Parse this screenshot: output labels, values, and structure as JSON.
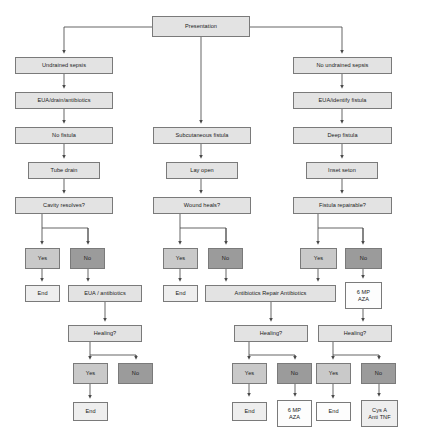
{
  "diagram": {
    "colors": {
      "box_light": "#e3e3e3",
      "box_mid": "#c9c9c9",
      "box_dark": "#9b9b9b",
      "box_white": "#fdfdfd",
      "border": "#7a7a7a",
      "connector": "#4a4a4a",
      "background": "#ffffff"
    },
    "nodes": [
      {
        "id": "presentation",
        "label": "Presentation",
        "x": 152,
        "y": 16,
        "w": 98,
        "h": 21,
        "fill": "fill-light"
      },
      {
        "id": "undrained-sepsis",
        "label": "Undrained sepsis",
        "x": 15,
        "y": 57,
        "w": 98,
        "h": 17,
        "fill": "fill-light"
      },
      {
        "id": "eua-drain-abx",
        "label": "EUA/drain/antibiotics",
        "x": 15,
        "y": 92,
        "w": 98,
        "h": 17,
        "fill": "fill-light"
      },
      {
        "id": "no-fistula",
        "label": "No fistula",
        "x": 15,
        "y": 127,
        "w": 98,
        "h": 17,
        "fill": "fill-light"
      },
      {
        "id": "tube-drain",
        "label": "Tube drain",
        "x": 28,
        "y": 162,
        "w": 72,
        "h": 17,
        "fill": "fill-light"
      },
      {
        "id": "cavity-resolves",
        "label": "Cavity resolves?",
        "x": 15,
        "y": 197,
        "w": 98,
        "h": 17,
        "fill": "fill-light"
      },
      {
        "id": "cavity-yes",
        "label": "Yes",
        "x": 25,
        "y": 248,
        "w": 35,
        "h": 21,
        "fill": "fill-mid"
      },
      {
        "id": "cavity-no",
        "label": "No",
        "x": 70,
        "y": 248,
        "w": 35,
        "h": 21,
        "fill": "fill-dark"
      },
      {
        "id": "cavity-end",
        "label": "End",
        "x": 25,
        "y": 285,
        "w": 35,
        "h": 17,
        "fill": "fill-faint"
      },
      {
        "id": "eua-antibiotics",
        "label": "EUA / antibiotics",
        "x": 68,
        "y": 285,
        "w": 74,
        "h": 17,
        "fill": "fill-light"
      },
      {
        "id": "healing-left",
        "label": "Healing?",
        "x": 68,
        "y": 325,
        "w": 74,
        "h": 17,
        "fill": "fill-light"
      },
      {
        "id": "healing-left-yes",
        "label": "Yes",
        "x": 73,
        "y": 363,
        "w": 35,
        "h": 21,
        "fill": "fill-mid"
      },
      {
        "id": "healing-left-no",
        "label": "No",
        "x": 118,
        "y": 363,
        "w": 35,
        "h": 21,
        "fill": "fill-dark"
      },
      {
        "id": "healing-left-end",
        "label": "End",
        "x": 73,
        "y": 402,
        "w": 35,
        "h": 19,
        "fill": "fill-faint"
      },
      {
        "id": "subcut-fistula",
        "label": "Subcutaneous fistula",
        "x": 153,
        "y": 127,
        "w": 98,
        "h": 17,
        "fill": "fill-light"
      },
      {
        "id": "lay-open",
        "label": "Lay open",
        "x": 166,
        "y": 162,
        "w": 72,
        "h": 17,
        "fill": "fill-light"
      },
      {
        "id": "wound-heals",
        "label": "Wound heals?",
        "x": 153,
        "y": 197,
        "w": 98,
        "h": 17,
        "fill": "fill-light"
      },
      {
        "id": "wound-yes",
        "label": "Yes",
        "x": 163,
        "y": 248,
        "w": 35,
        "h": 21,
        "fill": "fill-mid"
      },
      {
        "id": "wound-no",
        "label": "No",
        "x": 208,
        "y": 248,
        "w": 35,
        "h": 21,
        "fill": "fill-dark"
      },
      {
        "id": "wound-end",
        "label": "End",
        "x": 163,
        "y": 285,
        "w": 35,
        "h": 17,
        "fill": "fill-faint"
      },
      {
        "id": "abx-repair-abx",
        "label": "Antibiotics Repair Antibiotics",
        "x": 205,
        "y": 285,
        "w": 131,
        "h": 17,
        "fill": "fill-light"
      },
      {
        "id": "healing-mid",
        "label": "Healing?",
        "x": 234,
        "y": 325,
        "w": 74,
        "h": 17,
        "fill": "fill-light"
      },
      {
        "id": "healing-mid-yes",
        "label": "Yes",
        "x": 232,
        "y": 363,
        "w": 35,
        "h": 21,
        "fill": "fill-mid"
      },
      {
        "id": "healing-mid-no",
        "label": "No",
        "x": 277,
        "y": 363,
        "w": 35,
        "h": 21,
        "fill": "fill-dark"
      },
      {
        "id": "healing-mid-end",
        "label": "End",
        "x": 232,
        "y": 402,
        "w": 35,
        "h": 19,
        "fill": "fill-faint"
      },
      {
        "id": "healing-mid-6mp",
        "label": "6 MP\nAZA",
        "x": 277,
        "y": 400,
        "w": 35,
        "h": 27,
        "fill": "fill-white"
      },
      {
        "id": "no-undrained-sepsis",
        "label": "No undrained sepsis",
        "x": 293,
        "y": 57,
        "w": 99,
        "h": 17,
        "fill": "fill-light"
      },
      {
        "id": "eua-identify",
        "label": "EUA/identify fistula",
        "x": 293,
        "y": 92,
        "w": 99,
        "h": 17,
        "fill": "fill-light"
      },
      {
        "id": "deep-fistula",
        "label": "Deep fistula",
        "x": 293,
        "y": 127,
        "w": 99,
        "h": 17,
        "fill": "fill-light"
      },
      {
        "id": "inset-seton",
        "label": "Inset seton",
        "x": 306,
        "y": 162,
        "w": 72,
        "h": 17,
        "fill": "fill-light"
      },
      {
        "id": "fistula-repairable",
        "label": "Fistula repairable?",
        "x": 293,
        "y": 197,
        "w": 99,
        "h": 17,
        "fill": "fill-light"
      },
      {
        "id": "fistula-yes",
        "label": "Yes",
        "x": 300,
        "y": 248,
        "w": 37,
        "h": 21,
        "fill": "fill-mid"
      },
      {
        "id": "fistula-no",
        "label": "No",
        "x": 345,
        "y": 248,
        "w": 37,
        "h": 21,
        "fill": "fill-dark"
      },
      {
        "id": "fistula-6mp",
        "label": "6 MP\nAZA",
        "x": 345,
        "y": 282,
        "w": 37,
        "h": 27,
        "fill": "fill-white"
      },
      {
        "id": "healing-right",
        "label": "Healing?",
        "x": 318,
        "y": 325,
        "w": 74,
        "h": 17,
        "fill": "fill-light"
      },
      {
        "id": "healing-right-yes",
        "label": "Yes",
        "x": 316,
        "y": 363,
        "w": 35,
        "h": 21,
        "fill": "fill-mid"
      },
      {
        "id": "healing-right-no",
        "label": "No",
        "x": 361,
        "y": 363,
        "w": 35,
        "h": 21,
        "fill": "fill-dark"
      },
      {
        "id": "healing-right-end",
        "label": "End",
        "x": 316,
        "y": 402,
        "w": 35,
        "h": 19,
        "fill": "fill-white"
      },
      {
        "id": "cys-a-anti-tnf",
        "label": "Cys A\nAnti TNF",
        "x": 361,
        "y": 400,
        "w": 37,
        "h": 27,
        "fill": "fill-faint"
      }
    ]
  }
}
